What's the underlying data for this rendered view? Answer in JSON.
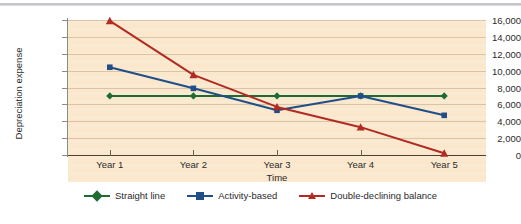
{
  "chart_data": {
    "type": "line",
    "title": "",
    "xlabel": "Time",
    "ylabel": "Depreciation expense",
    "categories": [
      "Year 1",
      "Year 2",
      "Year 3",
      "Year 4",
      "Year 5"
    ],
    "ylim": [
      0,
      16000
    ],
    "ytick_labels": [
      "0",
      "2,000",
      "4,000",
      "6,000",
      "8,000",
      "10,000",
      "12,000",
      "14,000",
      "16,000"
    ],
    "ytick_values": [
      0,
      2000,
      4000,
      6000,
      8000,
      10000,
      12000,
      14000,
      16000
    ],
    "grid": true,
    "legend_position": "bottom",
    "series": [
      {
        "name": "Straight line",
        "color": "#1f6b34",
        "marker": "diamond",
        "values": [
          7000,
          7000,
          7000,
          7000,
          7000
        ]
      },
      {
        "name": "Activity-based",
        "color": "#1f4e89",
        "marker": "square",
        "values": [
          10400,
          7900,
          5300,
          7000,
          4700
        ]
      },
      {
        "name": "Double-declining balance",
        "color": "#b32a22",
        "marker": "triangle",
        "values": [
          15900,
          9500,
          5700,
          3300,
          200
        ]
      }
    ]
  },
  "style": {
    "plot_background": "#fae7cc",
    "gridline_color": "#d9c4a6",
    "axis_color": "#4a3f33",
    "page_background": "#ffffff",
    "top_rule_color": "#cfcfd2"
  }
}
